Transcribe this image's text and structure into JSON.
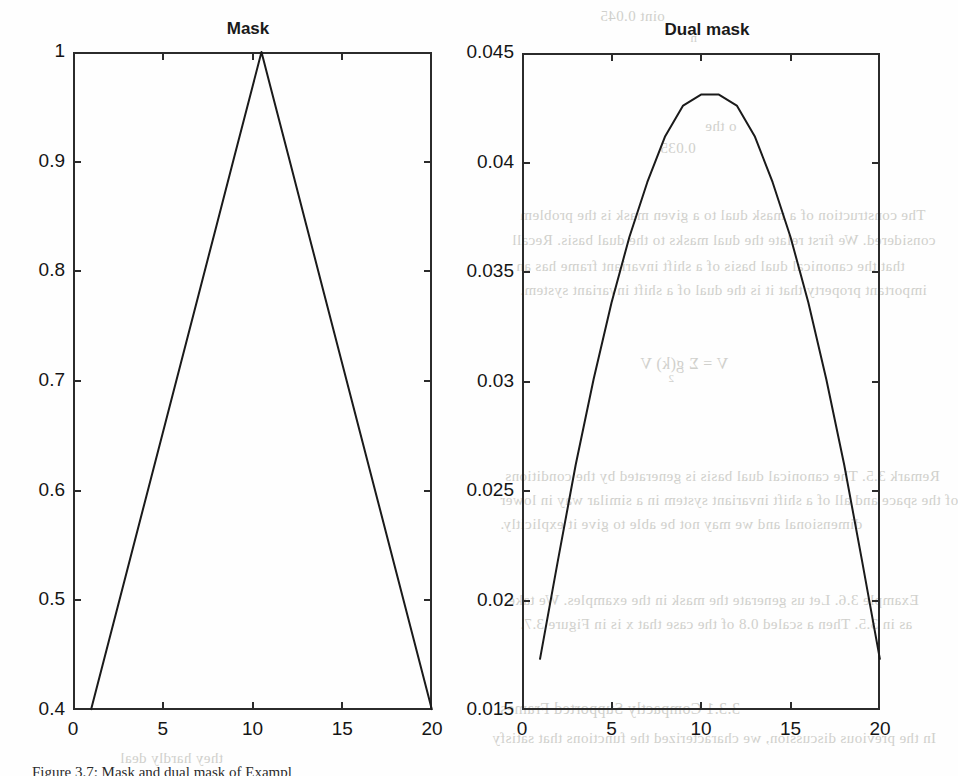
{
  "page": {
    "caption": "Figure 3.7: Mask and dual mask of Exampl",
    "background_bleed": [
      {
        "text": "oint 0.045",
        "x": 600,
        "y": 8,
        "size": 15
      },
      {
        "text": "n",
        "x": 690,
        "y": 30,
        "size": 13
      },
      {
        "text": "o the",
        "x": 705,
        "y": 118,
        "size": 15
      },
      {
        "text": "0.035",
        "x": 660,
        "y": 140,
        "size": 15
      },
      {
        "text": "The construction of a mask dual to a given mask is the problem",
        "x": 520,
        "y": 207,
        "size": 15
      },
      {
        "text": "considered. We first relate the dual masks to the dual basis. Recall",
        "x": 512,
        "y": 232,
        "size": 15
      },
      {
        "text": "that the canonical dual basis of a shift invariant frame has an",
        "x": 516,
        "y": 258,
        "size": 15
      },
      {
        "text": "important property that it is the dual of a shift invariant system.",
        "x": 520,
        "y": 282,
        "size": 15
      },
      {
        "text": "V  =   Σ   g(k) V",
        "x": 640,
        "y": 355,
        "size": 16
      },
      {
        "text": "2",
        "x": 668,
        "y": 372,
        "size": 11
      },
      {
        "text": "Remark 3.5.  The canonical dual basis is generated by the conditions",
        "x": 505,
        "y": 468,
        "size": 15
      },
      {
        "text": "of the space and all of a shift invariant system in a similar way in lower",
        "x": 500,
        "y": 492,
        "size": 15
      },
      {
        "text": "dimensional and we may not be able to give it explicitly.",
        "x": 500,
        "y": 516,
        "size": 15
      },
      {
        "text": "Example 3.6.    Let us generate the mask in the examples. We take",
        "x": 508,
        "y": 592,
        "size": 15
      },
      {
        "text": "as in 3.5. Then a scaled 0.8 of the case that x is in Figure 3.7.",
        "x": 520,
        "y": 616,
        "size": 15
      },
      {
        "text": "3.3.1   Compactly Supported Frames",
        "x": 500,
        "y": 700,
        "size": 16
      },
      {
        "text": "In the previous discussion, we characterized the functions that satisfy",
        "x": 492,
        "y": 730,
        "size": 15
      },
      {
        "text": "they hardly deal",
        "x": 120,
        "y": 750,
        "size": 15
      }
    ]
  },
  "chart_data": [
    {
      "type": "line",
      "title": "Mask",
      "xlabel": "",
      "ylabel": "",
      "xlim": [
        0,
        20
      ],
      "ylim": [
        0.4,
        1
      ],
      "xticks": [
        0,
        5,
        10,
        15,
        20
      ],
      "xtick_labels": [
        "0",
        "5",
        "10",
        "15",
        "20"
      ],
      "yticks": [
        0.4,
        0.5,
        0.6,
        0.7,
        0.8,
        0.9,
        1
      ],
      "ytick_labels": [
        "0.4",
        "0.5",
        "0.6",
        "0.7",
        "0.8",
        "0.9",
        "1"
      ],
      "grid": false,
      "legend": null,
      "line_color": "#1a1a1a",
      "x": [
        1,
        2,
        3,
        4,
        5,
        6,
        7,
        8,
        9,
        10,
        10.5,
        11,
        12,
        13,
        14,
        15,
        16,
        17,
        18,
        19,
        20
      ],
      "values": [
        0.4,
        0.4632,
        0.5263,
        0.5895,
        0.6526,
        0.7158,
        0.7789,
        0.8421,
        0.9053,
        0.9684,
        1.0,
        0.9684,
        0.9053,
        0.8421,
        0.7789,
        0.7158,
        0.6526,
        0.5895,
        0.5263,
        0.4632,
        0.4
      ]
    },
    {
      "type": "line",
      "title": "Dual mask",
      "xlabel": "",
      "ylabel": "",
      "xlim": [
        0,
        20
      ],
      "ylim": [
        0.015,
        0.045
      ],
      "xticks": [
        0,
        5,
        10,
        15,
        20
      ],
      "xtick_labels": [
        "0",
        "5",
        "10",
        "15",
        "20"
      ],
      "yticks": [
        0.015,
        0.02,
        0.025,
        0.03,
        0.035,
        0.04,
        0.045
      ],
      "ytick_labels": [
        "0.015",
        "0.02",
        "0.025",
        "0.03",
        "0.035",
        "0.04",
        "0.045"
      ],
      "grid": false,
      "legend": null,
      "line_color": "#1a1a1a",
      "x": [
        1,
        2,
        3,
        4,
        5,
        6,
        7,
        8,
        9,
        10,
        11,
        12,
        13,
        14,
        15,
        16,
        17,
        18,
        19,
        20
      ],
      "values": [
        0.0173,
        0.0218,
        0.0262,
        0.0301,
        0.0336,
        0.0366,
        0.0391,
        0.0412,
        0.0426,
        0.0431,
        0.0431,
        0.0426,
        0.0412,
        0.0391,
        0.0366,
        0.0336,
        0.0301,
        0.0262,
        0.0218,
        0.0173
      ]
    }
  ]
}
